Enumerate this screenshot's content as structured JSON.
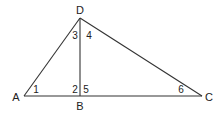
{
  "diagram": {
    "type": "geometry-triangle",
    "points": {
      "A": {
        "label": "A",
        "x": 24,
        "y": 96
      },
      "B": {
        "label": "B",
        "x": 80,
        "y": 96
      },
      "C": {
        "label": "C",
        "x": 202,
        "y": 96
      },
      "D": {
        "label": "D",
        "x": 80,
        "y": 18
      }
    },
    "segments": [
      "AD",
      "DC",
      "AC",
      "DB"
    ],
    "angles": [
      {
        "label": "1",
        "at": "A"
      },
      {
        "label": "2",
        "at": "B",
        "side": "left"
      },
      {
        "label": "3",
        "at": "D",
        "side": "left"
      },
      {
        "label": "4",
        "at": "D",
        "side": "right"
      },
      {
        "label": "5",
        "at": "B",
        "side": "right"
      },
      {
        "label": "6",
        "at": "C"
      }
    ],
    "stroke_color": "#333333"
  }
}
